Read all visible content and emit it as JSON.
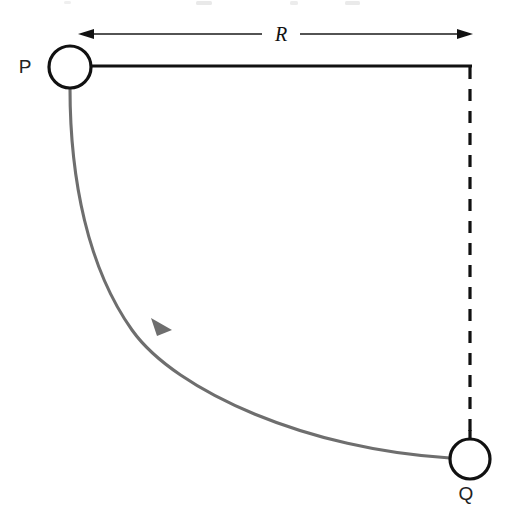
{
  "figure": {
    "background_color": "#ffffff",
    "width": 507,
    "height": 511,
    "labels": {
      "pivot_point": "P",
      "end_point": "Q",
      "radius_dimension": "R"
    },
    "colors": {
      "rod": "#111111",
      "dashed_line": "#111111",
      "arc_path": "#6e6e6e",
      "marker_stroke": "#111111",
      "marker_fill": "#ffffff",
      "dimension_line": "#1a1a1a",
      "label_text": "#222222"
    },
    "geometry": {
      "pivot_center_x": 70,
      "pivot_center_y": 67,
      "pivot_radius": 21,
      "end_center_x": 470,
      "end_center_y": 459,
      "end_radius": 20,
      "rod_y": 66,
      "rod_x_start": 91,
      "rod_x_end": 472,
      "dashed_x": 470,
      "dashed_y_start": 68,
      "dashed_y_end": 439,
      "dimension_y": 34,
      "dimension_x_start": 78,
      "dimension_x_end": 472
    },
    "elements": {
      "rod_name": "horizontal-rod",
      "dashed_name": "vertical-dashed-line",
      "arc_name": "swing-arc-path",
      "arrow_name": "swing-direction-arrowhead",
      "dimension_name": "radius-dimension-line"
    },
    "ghost_top_text": ""
  }
}
